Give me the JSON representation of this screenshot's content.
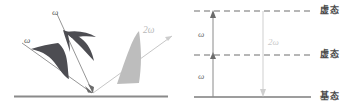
{
  "figure": {
    "background_color": "#ffffff"
  },
  "colors": {
    "fundamental_pulse": "#4d4d52",
    "second_harmonic_pulse": "#bdbdbd",
    "beam_line": "#8a8a8a",
    "surface_line": "#8a8a8a",
    "level_line": "#6e6e6e",
    "arrow_fundamental": "#8a8a8a",
    "arrow_second_harmonic": "#cfcfcf",
    "text_dark": "#4a4a4a",
    "text_light": "#c9c9c9"
  },
  "left_panel": {
    "name": "beam-geometry-panel",
    "incident_beams": [
      {
        "id": "beam-omega-lower",
        "label": "ω",
        "pulse_color": "#4d4d52"
      },
      {
        "id": "beam-omega-upper",
        "label": "ω",
        "pulse_color": "#4d4d52"
      }
    ],
    "outgoing_beam": {
      "id": "beam-two-omega",
      "label": "2ω",
      "pulse_color": "#bdbdbd"
    },
    "surface": {
      "id": "sample-surface",
      "label": ""
    }
  },
  "right_panel": {
    "name": "energy-level-panel",
    "levels": [
      {
        "id": "level-virtual-upper",
        "label": "虚态",
        "style": "dashed"
      },
      {
        "id": "level-virtual-lower",
        "label": "虚态",
        "style": "dashed"
      },
      {
        "id": "level-ground",
        "label": "基态",
        "style": "solid"
      }
    ],
    "transitions": [
      {
        "id": "transition-omega-lower",
        "label": "ω",
        "direction": "up",
        "color": "#8a8a8a"
      },
      {
        "id": "transition-omega-upper",
        "label": "ω",
        "direction": "up",
        "color": "#8a8a8a"
      },
      {
        "id": "transition-two-omega",
        "label": "2ω",
        "direction": "down",
        "color": "#cfcfcf"
      }
    ]
  }
}
